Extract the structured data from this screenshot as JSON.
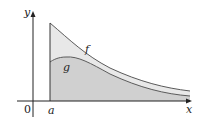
{
  "figure": {
    "axes": {
      "x_label": "x",
      "y_label": "y",
      "origin_label": "0"
    },
    "boundary_label": "a",
    "curves": [
      {
        "name": "f",
        "label": "f",
        "role": "upper curve"
      },
      {
        "name": "g",
        "label": "g",
        "role": "lower curve"
      }
    ],
    "colors": {
      "region_between": "#e6e6e6",
      "region_under_g": "#cfcfcf",
      "curve": "#555555",
      "axis": "#222222"
    }
  }
}
